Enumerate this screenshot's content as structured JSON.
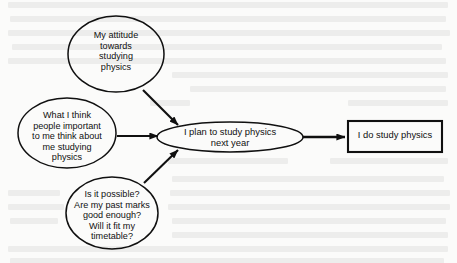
{
  "diagram": {
    "type": "flow-diagram",
    "background_color": "#fbfbfa",
    "stroke_color": "#101010",
    "nodes": [
      {
        "id": "attitude",
        "shape": "ellipse",
        "label": "My attitude\ntowards\nstudying\nphysics",
        "cx": 116,
        "cy": 54,
        "rx": 48,
        "ry": 38
      },
      {
        "id": "subjective-norm",
        "shape": "ellipse",
        "label": "What I think\npeople important\nto me think about\nme studying\nphysics",
        "cx": 67,
        "cy": 133,
        "rx": 49,
        "ry": 35
      },
      {
        "id": "perceived-control",
        "shape": "ellipse",
        "label": "Is it possible?\nAre my past marks\ngood enough?\nWill it fit my\ntimetable?",
        "cx": 112,
        "cy": 213,
        "rx": 46,
        "ry": 36
      },
      {
        "id": "intention",
        "shape": "ellipse",
        "label": "I plan to study physics\nnext year",
        "cx": 230,
        "cy": 137,
        "rx": 73,
        "ry": 15
      },
      {
        "id": "behaviour",
        "shape": "rectangle",
        "label": "I do study physics",
        "x": 348,
        "y": 121,
        "width": 94,
        "height": 31
      }
    ],
    "arrows": [
      {
        "id": "attitude-to-intention",
        "from": "attitude",
        "to": "intention",
        "x1": 143,
        "y1": 90,
        "x2": 178,
        "y2": 125
      },
      {
        "id": "norm-to-intention",
        "from": "subjective-norm",
        "to": "intention",
        "x1": 117,
        "y1": 136,
        "x2": 158,
        "y2": 136
      },
      {
        "id": "control-to-intention",
        "from": "perceived-control",
        "to": "intention",
        "x1": 144,
        "y1": 183,
        "x2": 178,
        "y2": 150
      },
      {
        "id": "intention-to-behaviour",
        "from": "intention",
        "to": "behaviour",
        "x1": 303,
        "y1": 137,
        "x2": 345,
        "y2": 137
      }
    ]
  }
}
